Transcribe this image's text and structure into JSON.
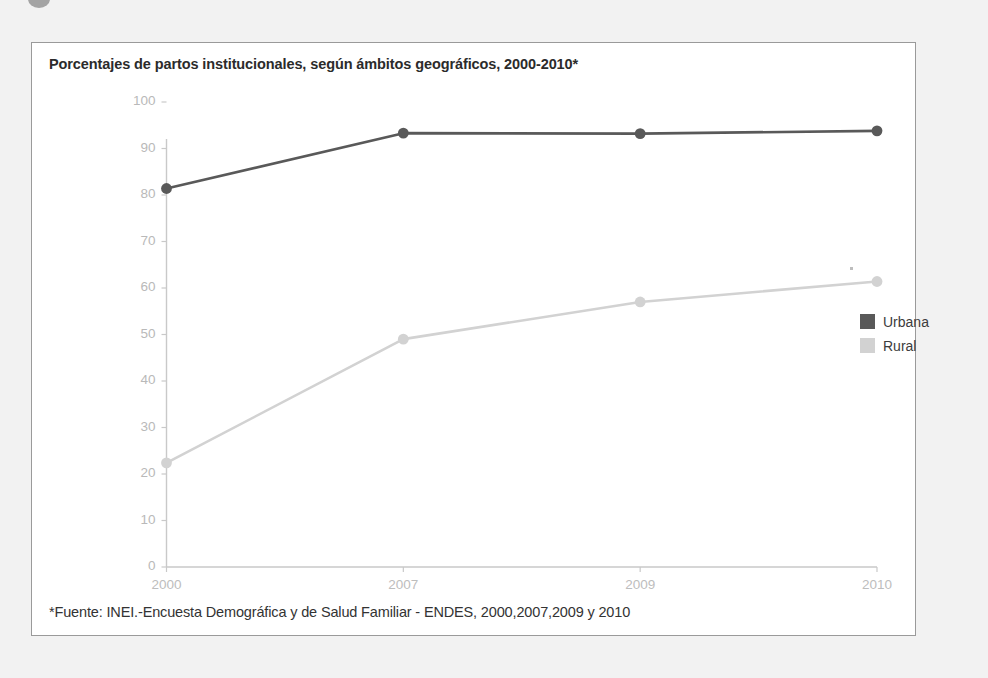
{
  "figure": {
    "title": "Porcentajes de partos institucionales, según ámbitos geográficos, 2000-2010*",
    "footnote": "*Fuente: INEI.-Encuesta Demográfica y de Salud Familiar - ENDES, 2000,2007,2009 y 2010"
  },
  "legend": {
    "position": "right",
    "items": [
      {
        "label": "Urbana",
        "color": "#595959"
      },
      {
        "label": "Rural",
        "color": "#d2d2d2"
      }
    ]
  },
  "chart_data": {
    "type": "line",
    "title": "Porcentajes de partos institucionales, según ámbitos geográficos, 2000-2010*",
    "xlabel": "",
    "ylabel": "",
    "categories": [
      "2000",
      "2007",
      "2009",
      "2010"
    ],
    "series": [
      {
        "name": "Urbana",
        "color": "#595959",
        "values": [
          81.4,
          93.3,
          93.2,
          93.8
        ]
      },
      {
        "name": "Rural",
        "color": "#d2d2d2",
        "values": [
          22.4,
          49.0,
          57.0,
          61.4
        ]
      }
    ],
    "ylim": [
      0,
      100
    ],
    "yticks": [
      0,
      10,
      20,
      30,
      40,
      50,
      60,
      70,
      80,
      90,
      100
    ],
    "ytick_labels": [
      "0",
      "10",
      "20",
      "30",
      "40",
      "50",
      "60",
      "70",
      "80",
      "90",
      "100"
    ],
    "xtick_labels": [
      "2000",
      "2007",
      "2009",
      "2010"
    ],
    "grid": false,
    "legend": [
      "Urbana",
      "Rural"
    ],
    "legend_position": "right",
    "annotations": [],
    "source": "*Fuente: INEI.-Encuesta Demográfica y de Salud Familiar - ENDES, 2000,2007,2009 y 2010"
  }
}
